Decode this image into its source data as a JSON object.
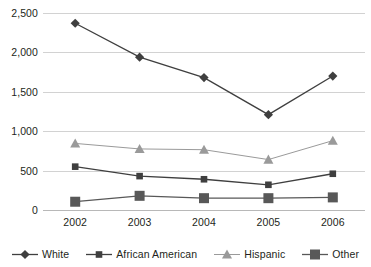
{
  "chart_data": {
    "type": "line",
    "title": "",
    "subtitle": "",
    "xlabel": "",
    "ylabel": "",
    "categories": [
      "2002",
      "2003",
      "2004",
      "2005",
      "2006"
    ],
    "ylim": [
      0,
      2500
    ],
    "yticks": [
      0,
      500,
      1000,
      1500,
      2000,
      2500
    ],
    "ytick_labels": [
      "0",
      "500",
      "1,000",
      "1,500",
      "2,000",
      "2,500"
    ],
    "grid": true,
    "legend_position": "bottom",
    "series": [
      {
        "name": "White",
        "marker": "diamond",
        "color": "#3f3f3f",
        "values": [
          2370,
          1940,
          1680,
          1210,
          1700
        ]
      },
      {
        "name": "African American",
        "marker": "square",
        "color": "#3f3f3f",
        "values": [
          550,
          430,
          390,
          320,
          460
        ]
      },
      {
        "name": "Hispanic",
        "marker": "triangle",
        "color": "#9a9a9a",
        "values": [
          845,
          775,
          765,
          640,
          880
        ]
      },
      {
        "name": "Other",
        "marker": "big-square",
        "color": "#585858",
        "values": [
          105,
          180,
          150,
          150,
          160
        ]
      }
    ]
  },
  "legend": {
    "items": [
      {
        "label": "White",
        "icon": "diamond-marker-icon"
      },
      {
        "label": "African American",
        "icon": "square-marker-icon"
      },
      {
        "label": "Hispanic",
        "icon": "triangle-marker-icon"
      },
      {
        "label": "Other",
        "icon": "big-square-marker-icon"
      }
    ]
  },
  "colors": {
    "gridline": "#d2d2d2",
    "text": "#231f20",
    "dark_series": "#3f3f3f",
    "gray_series": "#9a9a9a",
    "other_series": "#585858"
  }
}
